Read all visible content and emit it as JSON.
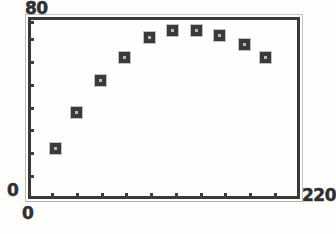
{
  "chart_data": {
    "type": "scatter",
    "title": "",
    "subtitle": "",
    "xlabel": "",
    "ylabel": "",
    "xlim": [
      0,
      220
    ],
    "ylim": [
      0,
      80
    ],
    "grid": false,
    "legend": null,
    "x_tick_labels": [
      "0",
      "220"
    ],
    "y_tick_labels": [
      "0",
      "80"
    ],
    "x_tick_interval": 20,
    "y_tick_interval": 10,
    "x_interior_tick_count": 10,
    "y_interior_tick_count": 8,
    "marker_style": "filled-square",
    "marker_color": "#3a3a3c",
    "frame_color": "#39393b",
    "background_color": "#fdfdfc",
    "points": [
      {
        "x": 22,
        "y": 22
      },
      {
        "x": 39,
        "y": 38
      },
      {
        "x": 59,
        "y": 52
      },
      {
        "x": 78,
        "y": 62
      },
      {
        "x": 98,
        "y": 71
      },
      {
        "x": 117,
        "y": 74
      },
      {
        "x": 136,
        "y": 74
      },
      {
        "x": 155,
        "y": 72
      },
      {
        "x": 175,
        "y": 68
      },
      {
        "x": 192,
        "y": 62
      }
    ]
  },
  "axes": {
    "y_max_label": "80",
    "y_min_label": "0",
    "x_min_label": "0",
    "x_max_label": "220"
  }
}
